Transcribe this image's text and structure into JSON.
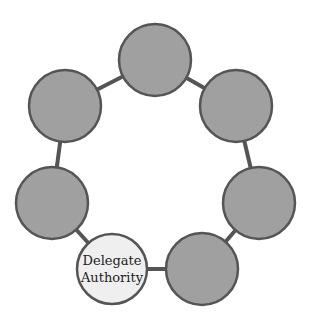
{
  "diagram": {
    "type": "cycle",
    "node_count": 7,
    "colors": {
      "node_fill": "#a0a0a0",
      "node_stroke": "#555555",
      "highlight_fill": "#efefef",
      "connector": "#555555",
      "background": "#ffffff"
    },
    "nodes": [
      {
        "id": "top",
        "label": "",
        "cx": 155,
        "cy": 60,
        "r": 36,
        "highlight": false
      },
      {
        "id": "top-right",
        "label": "",
        "cx": 236,
        "cy": 106,
        "r": 36,
        "highlight": false
      },
      {
        "id": "right",
        "label": "",
        "cx": 259,
        "cy": 203,
        "r": 36,
        "highlight": false
      },
      {
        "id": "bottom-right",
        "label": "",
        "cx": 202,
        "cy": 269,
        "r": 36,
        "highlight": false
      },
      {
        "id": "bottom-left",
        "label": "Delegate Authority",
        "line1": "Delegate",
        "line2": "Authority",
        "cx": 112,
        "cy": 269,
        "r": 35,
        "highlight": true
      },
      {
        "id": "left",
        "label": "",
        "cx": 52,
        "cy": 203,
        "r": 36,
        "highlight": false
      },
      {
        "id": "top-left",
        "label": "",
        "cx": 65,
        "cy": 106,
        "r": 36,
        "highlight": false
      }
    ]
  }
}
